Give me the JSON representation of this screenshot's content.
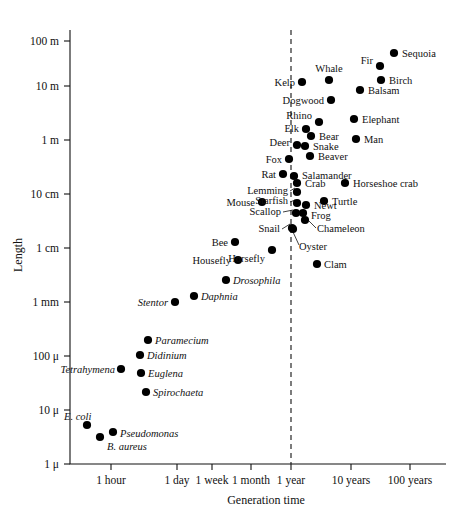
{
  "chart_data": {
    "type": "scatter",
    "title": "",
    "xlabel": "Generation time",
    "ylabel": "Length",
    "grid": false,
    "legend": "none",
    "xtick_labels": [
      "1 hour",
      "1 day",
      "1 week",
      "1 month",
      "1 year",
      "10 years",
      "100 years"
    ],
    "ytick_labels": [
      "1 μ",
      "10 μ",
      "100 μ",
      "1 mm",
      "1 cm",
      "10 cm",
      "1 m",
      "10 m",
      "100 m"
    ],
    "annotations": [
      {
        "text": "1 year",
        "kind": "dashed-vertical-reference-line"
      }
    ],
    "points": [
      {
        "label": "E. coli",
        "italic": true,
        "x": 87,
        "y": 425,
        "label_x": 64,
        "label_y": 420,
        "label_anchor": "start"
      },
      {
        "label": "B. aureus",
        "italic": true,
        "x": 100,
        "y": 437,
        "label_x": 107,
        "label_y": 450,
        "label_anchor": "start"
      },
      {
        "label": "Pseudomonas",
        "italic": true,
        "x": 113,
        "y": 432,
        "label_x": 120,
        "label_y": 437,
        "label_anchor": "start"
      },
      {
        "label": "Tetrahymena",
        "italic": true,
        "x": 121,
        "y": 369,
        "label_x": 115,
        "label_y": 373,
        "label_anchor": "end"
      },
      {
        "label": "Spirochaeta",
        "italic": true,
        "x": 146,
        "y": 392,
        "label_x": 153,
        "label_y": 396,
        "label_anchor": "start"
      },
      {
        "label": "Euglena",
        "italic": true,
        "x": 141,
        "y": 373,
        "label_x": 148,
        "label_y": 377,
        "label_anchor": "start"
      },
      {
        "label": "Didinium",
        "italic": true,
        "x": 140,
        "y": 355,
        "label_x": 147,
        "label_y": 359,
        "label_anchor": "start"
      },
      {
        "label": "Paramecium",
        "italic": true,
        "x": 148,
        "y": 340,
        "label_x": 155,
        "label_y": 344,
        "label_anchor": "start"
      },
      {
        "label": "Stentor",
        "italic": true,
        "x": 175,
        "y": 302,
        "label_x": 168,
        "label_y": 306,
        "label_anchor": "end"
      },
      {
        "label": "Daphnia",
        "italic": true,
        "x": 194,
        "y": 296,
        "label_x": 201,
        "label_y": 300,
        "label_anchor": "start"
      },
      {
        "label": "Drosophila",
        "italic": true,
        "x": 226,
        "y": 280,
        "label_x": 233,
        "label_y": 284,
        "label_anchor": "start"
      },
      {
        "label": "Housefly",
        "italic": false,
        "x": 238,
        "y": 260,
        "label_x": 231,
        "label_y": 264,
        "label_anchor": "end"
      },
      {
        "label": "Bee",
        "italic": false,
        "x": 235,
        "y": 242,
        "label_x": 228,
        "label_y": 246,
        "label_anchor": "end"
      },
      {
        "label": "Horsefly",
        "italic": false,
        "x": 272,
        "y": 250,
        "label_x": 265,
        "label_y": 262,
        "label_anchor": "end"
      },
      {
        "label": "Clam",
        "italic": false,
        "x": 317,
        "y": 264,
        "label_x": 324,
        "label_y": 268,
        "label_anchor": "start"
      },
      {
        "label": "Oyster",
        "italic": false,
        "x": 292,
        "y": 228,
        "label_x": 299,
        "label_y": 250,
        "label_anchor": "start",
        "leader": [
          299,
          245,
          293,
          232
        ]
      },
      {
        "label": "Snail",
        "italic": false,
        "x": 293,
        "y": 229,
        "label_x": 280,
        "label_y": 232,
        "label_anchor": "end",
        "leader": [
          282,
          229,
          290,
          224
        ]
      },
      {
        "label": "Chameleon",
        "italic": false,
        "x": 305,
        "y": 220,
        "label_x": 317,
        "label_y": 232,
        "label_anchor": "start",
        "leader": [
          316,
          228,
          307,
          219
        ]
      },
      {
        "label": "Frog",
        "italic": false,
        "x": 303,
        "y": 213,
        "label_x": 311,
        "label_y": 219,
        "label_anchor": "start"
      },
      {
        "label": "Newt",
        "italic": false,
        "x": 306,
        "y": 205,
        "label_x": 314,
        "label_y": 209,
        "label_anchor": "start"
      },
      {
        "label": "Scallop",
        "italic": false,
        "x": 296,
        "y": 213,
        "label_x": 281,
        "label_y": 215,
        "label_anchor": "end",
        "leader": [
          283,
          212,
          293,
          210
        ]
      },
      {
        "label": "Starfish",
        "italic": false,
        "x": 297,
        "y": 203,
        "label_x": 288,
        "label_y": 204,
        "label_anchor": "end",
        "leader": [
          290,
          202,
          295,
          200
        ]
      },
      {
        "label": "Mouse",
        "italic": false,
        "x": 262,
        "y": 202,
        "label_x": 255,
        "label_y": 206,
        "label_anchor": "end"
      },
      {
        "label": "Lemming",
        "italic": false,
        "x": 297,
        "y": 192,
        "label_x": 288,
        "label_y": 194,
        "label_anchor": "end",
        "leader": [
          290,
          191,
          295,
          188
        ]
      },
      {
        "label": "Turtle",
        "italic": false,
        "x": 324,
        "y": 201,
        "label_x": 332,
        "label_y": 205,
        "label_anchor": "start"
      },
      {
        "label": "Crab",
        "italic": false,
        "x": 297,
        "y": 183,
        "label_x": 305,
        "label_y": 187,
        "label_anchor": "start"
      },
      {
        "label": "Salamander",
        "italic": false,
        "x": 294,
        "y": 176,
        "label_x": 302,
        "label_y": 179,
        "label_anchor": "start"
      },
      {
        "label": "Horseshoe crab",
        "italic": false,
        "x": 345,
        "y": 183,
        "label_x": 353,
        "label_y": 187,
        "label_anchor": "start"
      },
      {
        "label": "Rat",
        "italic": false,
        "x": 283,
        "y": 174,
        "label_x": 276,
        "label_y": 178,
        "label_anchor": "end"
      },
      {
        "label": "Fox",
        "italic": false,
        "x": 289,
        "y": 159,
        "label_x": 282,
        "label_y": 163,
        "label_anchor": "end"
      },
      {
        "label": "Beaver",
        "italic": false,
        "x": 310,
        "y": 156,
        "label_x": 318,
        "label_y": 160,
        "label_anchor": "start"
      },
      {
        "label": "Snake",
        "italic": false,
        "x": 305,
        "y": 146,
        "label_x": 313,
        "label_y": 150,
        "label_anchor": "start"
      },
      {
        "label": "Deer",
        "italic": false,
        "x": 297,
        "y": 145,
        "label_x": 290,
        "label_y": 146,
        "label_anchor": "end"
      },
      {
        "label": "Bear",
        "italic": false,
        "x": 311,
        "y": 136,
        "label_x": 319,
        "label_y": 140,
        "label_anchor": "start"
      },
      {
        "label": "Man",
        "italic": false,
        "x": 356,
        "y": 139,
        "label_x": 364,
        "label_y": 143,
        "label_anchor": "start"
      },
      {
        "label": "Elk",
        "italic": false,
        "x": 306,
        "y": 129,
        "label_x": 299,
        "label_y": 132,
        "label_anchor": "end"
      },
      {
        "label": "Rhino",
        "italic": false,
        "x": 319,
        "y": 122,
        "label_x": 312,
        "label_y": 119,
        "label_anchor": "end"
      },
      {
        "label": "Elephant",
        "italic": false,
        "x": 354,
        "y": 119,
        "label_x": 362,
        "label_y": 123,
        "label_anchor": "start"
      },
      {
        "label": "Dogwood",
        "italic": false,
        "x": 331,
        "y": 100,
        "label_x": 324,
        "label_y": 104,
        "label_anchor": "end"
      },
      {
        "label": "Balsam",
        "italic": false,
        "x": 360,
        "y": 90,
        "label_x": 368,
        "label_y": 94,
        "label_anchor": "start"
      },
      {
        "label": "Kelp",
        "italic": false,
        "x": 302,
        "y": 82,
        "label_x": 295,
        "label_y": 86,
        "label_anchor": "end"
      },
      {
        "label": "Whale",
        "italic": false,
        "x": 329,
        "y": 80,
        "label_x": 329,
        "label_y": 72,
        "label_anchor": "middle"
      },
      {
        "label": "Birch",
        "italic": false,
        "x": 381,
        "y": 80,
        "label_x": 389,
        "label_y": 84,
        "label_anchor": "start"
      },
      {
        "label": "Fir",
        "italic": false,
        "x": 380,
        "y": 66,
        "label_x": 373,
        "label_y": 64,
        "label_anchor": "end"
      },
      {
        "label": "Sequoia",
        "italic": false,
        "x": 394,
        "y": 53,
        "label_x": 402,
        "label_y": 57,
        "label_anchor": "start"
      }
    ],
    "x_ticks_px": [
      111,
      177,
      212,
      251,
      291,
      351,
      410
    ],
    "y_ticks_px": [
      464,
      410,
      356,
      302,
      248,
      194,
      140,
      86,
      41
    ],
    "axis": {
      "x0": 70,
      "x1": 446,
      "y0": 30,
      "y1": 464
    }
  }
}
